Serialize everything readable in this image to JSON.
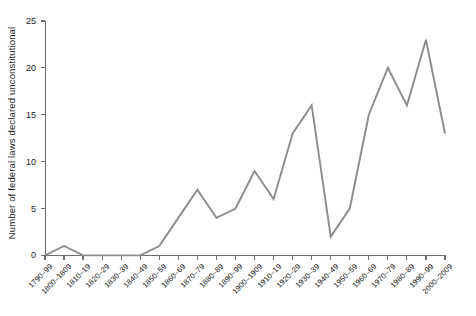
{
  "chart_data": {
    "type": "line",
    "title": "",
    "xlabel": "",
    "ylabel": "Number of federal laws declared unconstitutional",
    "categories": [
      "1790–99",
      "1800–1809",
      "1810–19",
      "1820–29",
      "1830–39",
      "1840–49",
      "1850–59",
      "1860–69",
      "1870–79",
      "1880–89",
      "1890–99",
      "1900–1909",
      "1910–19",
      "1920–29",
      "1930–39",
      "1940–49",
      "1950–59",
      "1960–69",
      "1970–79",
      "1980–89",
      "1990–99",
      "2000–2009"
    ],
    "values": [
      0,
      1,
      0,
      0,
      0,
      0,
      1,
      4,
      7,
      4,
      5,
      9,
      6,
      13,
      16,
      2,
      5,
      15,
      20,
      16,
      23,
      13
    ],
    "ylim": [
      0,
      25
    ],
    "yticks": [
      0,
      5,
      10,
      15,
      20,
      25
    ],
    "ytick_labels": [
      "0",
      "5",
      "10",
      "15",
      "20",
      "25"
    ],
    "grid": false,
    "legend": null,
    "series_color": "#8c8c8c",
    "axis_color": "#6e6e6e",
    "text_color": "#1a1a1a",
    "background": "#ffffff"
  }
}
